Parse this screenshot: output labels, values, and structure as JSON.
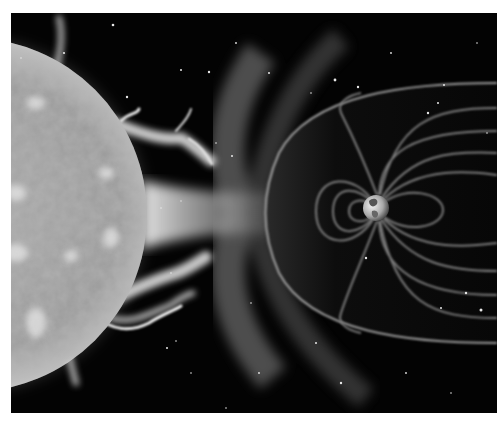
{
  "image": {
    "description": "Grayscale space illustration: the Sun on the left emitting solar wind and prominences toward Earth's magnetosphere on the right",
    "frame": {
      "x": 11,
      "y": 13,
      "width": 486,
      "height": 400
    },
    "colors": {
      "border": "#ffffff",
      "space": "#030303",
      "sun_core": "#b5b5b5",
      "sun_edge": "#8a8a8a",
      "plasma": "#e8e8e8",
      "field_line": "#8c8c8c",
      "magnetopause": "#a0a0a0",
      "earth": "#cfcfcf"
    },
    "objects": [
      {
        "name": "sun",
        "center": [
          -41,
          202
        ],
        "radius": 177
      },
      {
        "name": "solar-wind-jet",
        "from": [
          136,
          200
        ],
        "to": [
          260,
          200
        ]
      },
      {
        "name": "bow-shock-haze",
        "nose": [
          240,
          200
        ]
      },
      {
        "name": "magnetopause",
        "nose": [
          257,
          197
        ]
      },
      {
        "name": "earth",
        "center": [
          365,
          195
        ],
        "radius": 13
      }
    ]
  }
}
